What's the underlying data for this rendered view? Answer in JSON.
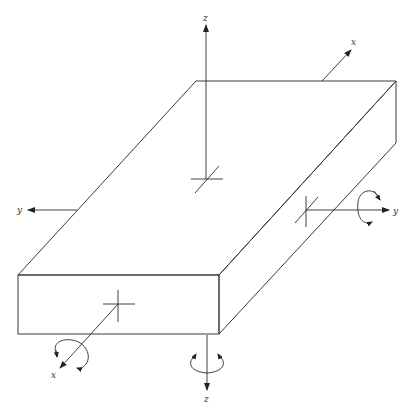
{
  "diagram": {
    "colors": {
      "top_face": "#ffffff",
      "front_face": "#b4b4b4",
      "side_face": "#dcdcdc",
      "lines": "#2a2a2a"
    },
    "labels": {
      "z_up": "z",
      "x_back": "x",
      "y_left": "y",
      "y_right": "y",
      "x_front": "x",
      "z_down": "z"
    }
  }
}
